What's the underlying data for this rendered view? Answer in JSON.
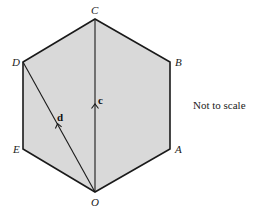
{
  "diagram": {
    "type": "regular-hexagon-vectors",
    "fill_color": "#d9d9d9",
    "stroke_color": "#1a1a1a",
    "vertices": [
      {
        "label": "C",
        "x": 95,
        "y": 19
      },
      {
        "label": "B",
        "x": 170,
        "y": 62
      },
      {
        "label": "A",
        "x": 170,
        "y": 149
      },
      {
        "label": "O",
        "x": 95,
        "y": 192
      },
      {
        "label": "E",
        "x": 23,
        "y": 149
      },
      {
        "label": "D",
        "x": 23,
        "y": 62
      }
    ],
    "vectors": [
      {
        "label": "c",
        "from": "O",
        "to": "C"
      },
      {
        "label": "d",
        "from": "O",
        "to": "D"
      }
    ],
    "labels": {
      "C": "C",
      "B": "B",
      "A": "A",
      "O": "O",
      "E": "E",
      "D": "D",
      "vec_c": "c",
      "vec_d": "d"
    },
    "note": "Not to scale"
  }
}
